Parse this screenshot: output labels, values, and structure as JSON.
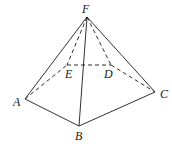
{
  "figure": {
    "labels": {
      "F": "F",
      "E": "E",
      "D": "D",
      "A": "A",
      "B": "B",
      "C": "C"
    },
    "colors": {
      "stroke": "#1a1a1a",
      "background": "#ffffff"
    }
  }
}
